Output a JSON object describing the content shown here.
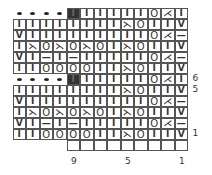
{
  "chart": {
    "columns": 13,
    "rows_top_to_bottom": [
      {
        "label": "",
        "cells": [
          "•",
          "•",
          "•",
          "•",
          "■",
          "I",
          "I",
          "I",
          "I",
          "I",
          "O",
          "⋌",
          "I"
        ]
      },
      {
        "label": "",
        "cells": [
          "I",
          "I",
          "I",
          "I",
          "I",
          "I",
          "I",
          "I",
          "⋋",
          "O",
          "I",
          "I",
          "V"
        ]
      },
      {
        "label": "",
        "cells": [
          "V",
          "I",
          "I",
          "I",
          "I",
          "I",
          "I",
          "I",
          "I",
          "I",
          "O",
          "⋌",
          "—"
        ]
      },
      {
        "label": "",
        "cells": [
          "I",
          "⋋",
          "O",
          "⋋",
          "O",
          "⋋",
          "O",
          "I",
          "⋋",
          "O",
          "I",
          "I",
          "V"
        ]
      },
      {
        "label": "",
        "cells": [
          "V",
          "I",
          "—",
          "I",
          "—",
          "I",
          "I",
          "I",
          "I",
          "I",
          "O",
          "⋌",
          "—"
        ]
      },
      {
        "label": "",
        "cells": [
          "I",
          "I",
          "O",
          "O",
          "O",
          "O",
          "I",
          "I",
          "⋋",
          "O",
          "I",
          "I",
          "V"
        ]
      },
      {
        "label": "6",
        "cells": [
          "•",
          "•",
          "•",
          "•",
          "■",
          "I",
          "I",
          "I",
          "I",
          "I",
          "O",
          "⋌",
          "I"
        ]
      },
      {
        "label": "5",
        "cells": [
          "I",
          "I",
          "I",
          "I",
          "I",
          "I",
          "I",
          "I",
          "⋋",
          "O",
          "I",
          "I",
          "V"
        ]
      },
      {
        "label": "",
        "cells": [
          "V",
          "I",
          "I",
          "I",
          "I",
          "I",
          "I",
          "I",
          "I",
          "I",
          "O",
          "⋌",
          "—"
        ]
      },
      {
        "label": "",
        "cells": [
          "I",
          "⋋",
          "O",
          "⋋",
          "O",
          "⋋",
          "O",
          "I",
          "⋋",
          "O",
          "I",
          "I",
          "V"
        ]
      },
      {
        "label": "",
        "cells": [
          "V",
          "I",
          "—",
          "I",
          "—",
          "I",
          "I",
          "I",
          "I",
          "I",
          "O",
          "⋌",
          "—"
        ]
      },
      {
        "label": "1",
        "cells": [
          "I",
          "I",
          "O",
          "O",
          "O",
          "O",
          "I",
          "I",
          "⋋",
          "O",
          "I",
          "I",
          "V"
        ]
      },
      {
        "label": "",
        "cells": [
          "",
          "",
          "",
          "",
          "_",
          "_",
          "_",
          "_",
          "_",
          "_",
          "_",
          "_",
          "_"
        ]
      }
    ],
    "column_labels": [
      {
        "text": "9",
        "col": 4
      },
      {
        "text": "5",
        "col": 8
      },
      {
        "text": "1",
        "col": 12
      }
    ],
    "legend_symbols": {
      "I": "knit",
      "—": "purl",
      "O": "yarn over",
      "⋋": "decrease (left)",
      "⋌": "decrease (right)",
      "V": "slip stitch",
      "•": "no stitch / bind",
      "■": "no stitch (black)"
    }
  }
}
